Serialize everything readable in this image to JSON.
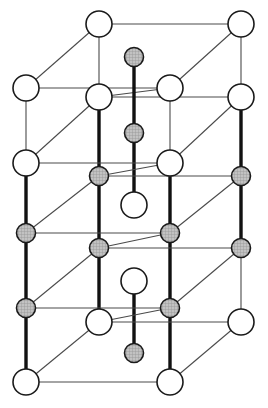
{
  "figure": {
    "width": 268,
    "height": 408,
    "background_color": "#ffffff"
  },
  "style": {
    "open_atom_fill": "#ffffff",
    "open_atom_stroke": "#1a1a1a",
    "open_atom_stroke_width": 1.6,
    "shaded_atom_fill": "#b9b9b9",
    "shaded_atom_stroke": "#1a1a1a",
    "shaded_atom_stroke_width": 1.6,
    "hatch_color": "#8c8c8c",
    "thin_bond_color": "#4a4a4a",
    "thin_bond_width": 1.1,
    "thick_bond_color": "#111111",
    "thick_bond_width": 3.4,
    "open_atom_radius": 13,
    "shaded_atom_radius": 9.5
  },
  "legend": {
    "open_atom_label": "large open atom",
    "shaded_atom_label": "small shaded atom",
    "thin_bond_label": "back edge",
    "thick_bond_label": "front vertical edge"
  },
  "geometry": {
    "columns": {
      "left_front": 26,
      "left_back": 99,
      "center": 134,
      "right_front": 170,
      "right_back": 241
    },
    "rows": {
      "top_back": 24,
      "top_front": 97,
      "mid_upper_back": 163,
      "mid_upper_front": 176,
      "mid_lower_back": 233,
      "mid_lower_front": 248,
      "bottom_back": 308,
      "bottom_front": 322,
      "base": 382
    }
  },
  "atoms": [
    {
      "id": "a1",
      "name": "atom-top-back-left",
      "x": 99,
      "y": 24,
      "type": "open"
    },
    {
      "id": "a2",
      "name": "atom-top-back-right",
      "x": 241,
      "y": 24,
      "type": "open"
    },
    {
      "id": "a3",
      "name": "atom-center-upper-shaded",
      "x": 134,
      "y": 57,
      "type": "shaded"
    },
    {
      "id": "a4",
      "name": "atom-upper-left-outer",
      "x": 26,
      "y": 88,
      "type": "open"
    },
    {
      "id": "a5",
      "name": "atom-upper-mid-left",
      "x": 99,
      "y": 97,
      "type": "open"
    },
    {
      "id": "a6",
      "name": "atom-upper-mid-right",
      "x": 170,
      "y": 88,
      "type": "open"
    },
    {
      "id": "a7",
      "name": "atom-upper-right-outer",
      "x": 241,
      "y": 97,
      "type": "open"
    },
    {
      "id": "a8",
      "name": "atom-center-second-shaded",
      "x": 134,
      "y": 133,
      "type": "shaded"
    },
    {
      "id": "a9",
      "name": "atom-mid-left-outer",
      "x": 26,
      "y": 163,
      "type": "open"
    },
    {
      "id": "a10",
      "name": "atom-mid-left-shaded",
      "x": 99,
      "y": 176,
      "type": "shaded"
    },
    {
      "id": "a11",
      "name": "atom-mid-right-open",
      "x": 170,
      "y": 163,
      "type": "open"
    },
    {
      "id": "a12",
      "name": "atom-mid-right-shaded",
      "x": 241,
      "y": 176,
      "type": "shaded"
    },
    {
      "id": "a13",
      "name": "atom-center-open-upper",
      "x": 134,
      "y": 205,
      "type": "open"
    },
    {
      "id": "a14",
      "name": "atom-midlow-left-shaded",
      "x": 26,
      "y": 233,
      "type": "shaded"
    },
    {
      "id": "a15",
      "name": "atom-midlow-inner-shaded",
      "x": 99,
      "y": 248,
      "type": "shaded"
    },
    {
      "id": "a16",
      "name": "atom-midlow-right-shaded",
      "x": 170,
      "y": 233,
      "type": "shaded"
    },
    {
      "id": "a17",
      "name": "atom-midlow-outer-shaded",
      "x": 241,
      "y": 248,
      "type": "shaded"
    },
    {
      "id": "a18",
      "name": "atom-center-open-lower",
      "x": 134,
      "y": 281,
      "type": "open"
    },
    {
      "id": "a19",
      "name": "atom-low-left-shaded",
      "x": 26,
      "y": 308,
      "type": "shaded"
    },
    {
      "id": "a20",
      "name": "atom-low-inner-open",
      "x": 99,
      "y": 322,
      "type": "open"
    },
    {
      "id": "a21",
      "name": "atom-low-right-shaded",
      "x": 170,
      "y": 308,
      "type": "shaded"
    },
    {
      "id": "a22",
      "name": "atom-low-outer-open",
      "x": 241,
      "y": 322,
      "type": "open"
    },
    {
      "id": "a23",
      "name": "atom-center-bottom-shaded",
      "x": 134,
      "y": 353,
      "type": "shaded"
    },
    {
      "id": "a24",
      "name": "atom-base-front-left",
      "x": 26,
      "y": 382,
      "type": "open"
    },
    {
      "id": "a25",
      "name": "atom-base-front-right",
      "x": 170,
      "y": 382,
      "type": "open"
    }
  ],
  "bonds": [
    {
      "name": "bond-top-back-horizontal",
      "x1": 99,
      "y1": 24,
      "x2": 241,
      "y2": 24,
      "weight": "thin"
    },
    {
      "name": "bond-top-back-left-diagonal",
      "x1": 99,
      "y1": 24,
      "x2": 26,
      "y2": 88,
      "weight": "thin"
    },
    {
      "name": "bond-top-back-right-diagonal",
      "x1": 241,
      "y1": 24,
      "x2": 170,
      "y2": 88,
      "weight": "thin"
    },
    {
      "name": "bond-topbackleft-vertical",
      "x1": 99,
      "y1": 24,
      "x2": 99,
      "y2": 97,
      "weight": "thin"
    },
    {
      "name": "bond-topbackright-vertical",
      "x1": 241,
      "y1": 24,
      "x2": 241,
      "y2": 97,
      "weight": "thin"
    },
    {
      "name": "bond-upper-left-horizontal",
      "x1": 26,
      "y1": 88,
      "x2": 170,
      "y2": 88,
      "weight": "thin"
    },
    {
      "name": "bond-upper-front-horizontal",
      "x1": 99,
      "y1": 97,
      "x2": 241,
      "y2": 97,
      "weight": "thin"
    },
    {
      "name": "bond-upper-left-vertical",
      "x1": 26,
      "y1": 88,
      "x2": 26,
      "y2": 163,
      "weight": "thin"
    },
    {
      "name": "bond-upper-right-vertical",
      "x1": 170,
      "y1": 88,
      "x2": 170,
      "y2": 163,
      "weight": "thin"
    },
    {
      "name": "bond-upper-mid-left-diag",
      "x1": 170,
      "y1": 88,
      "x2": 99,
      "y2": 97,
      "weight": "thin"
    },
    {
      "name": "bond-upper-outer-right-diag",
      "x1": 241,
      "y1": 97,
      "x2": 170,
      "y2": 163,
      "weight": "thin"
    },
    {
      "name": "bond-upper-left-down-diag",
      "x1": 99,
      "y1": 97,
      "x2": 26,
      "y2": 163,
      "weight": "thin"
    },
    {
      "name": "bond-center-chain-top",
      "x1": 134,
      "y1": 57,
      "x2": 134,
      "y2": 133,
      "weight": "thick"
    },
    {
      "name": "bond-center-chain-second",
      "x1": 134,
      "y1": 133,
      "x2": 134,
      "y2": 205,
      "weight": "thick"
    },
    {
      "name": "bond-frontleft-col-upper",
      "x1": 99,
      "y1": 97,
      "x2": 99,
      "y2": 176,
      "weight": "thick"
    },
    {
      "name": "bond-frontleft-col-mid",
      "x1": 99,
      "y1": 176,
      "x2": 99,
      "y2": 248,
      "weight": "thick"
    },
    {
      "name": "bond-frontleft-col-lower",
      "x1": 99,
      "y1": 248,
      "x2": 99,
      "y2": 322,
      "weight": "thick"
    },
    {
      "name": "bond-frontright-col-upper",
      "x1": 170,
      "y1": 163,
      "x2": 170,
      "y2": 233,
      "weight": "thick"
    },
    {
      "name": "bond-frontright-col-lower",
      "x1": 170,
      "y1": 233,
      "x2": 170,
      "y2": 308,
      "weight": "thick"
    },
    {
      "name": "bond-frontright-col-base",
      "x1": 170,
      "y1": 308,
      "x2": 170,
      "y2": 382,
      "weight": "thick"
    },
    {
      "name": "bond-outerleft-col-upper",
      "x1": 26,
      "y1": 163,
      "x2": 26,
      "y2": 233,
      "weight": "thick"
    },
    {
      "name": "bond-outerleft-col-mid",
      "x1": 26,
      "y1": 233,
      "x2": 26,
      "y2": 308,
      "weight": "thick"
    },
    {
      "name": "bond-outerleft-col-base",
      "x1": 26,
      "y1": 308,
      "x2": 26,
      "y2": 382,
      "weight": "thick"
    },
    {
      "name": "bond-outerright-col-upper",
      "x1": 241,
      "y1": 97,
      "x2": 241,
      "y2": 176,
      "weight": "thick"
    },
    {
      "name": "bond-outerright-col-mid",
      "x1": 241,
      "y1": 176,
      "x2": 241,
      "y2": 248,
      "weight": "thick"
    },
    {
      "name": "bond-outerright-col-lower",
      "x1": 241,
      "y1": 248,
      "x2": 241,
      "y2": 322,
      "weight": "thin"
    },
    {
      "name": "bond-mid-back-horizontal",
      "x1": 26,
      "y1": 163,
      "x2": 170,
      "y2": 163,
      "weight": "thin"
    },
    {
      "name": "bond-mid-front-horizontal",
      "x1": 99,
      "y1": 176,
      "x2": 241,
      "y2": 176,
      "weight": "thin"
    },
    {
      "name": "bond-mid-inner-diag",
      "x1": 170,
      "y1": 163,
      "x2": 99,
      "y2": 176,
      "weight": "thin"
    },
    {
      "name": "bond-mid-left-diag-down",
      "x1": 99,
      "y1": 176,
      "x2": 26,
      "y2": 233,
      "weight": "thin"
    },
    {
      "name": "bond-mid-right-diag-down",
      "x1": 241,
      "y1": 176,
      "x2": 170,
      "y2": 233,
      "weight": "thin"
    },
    {
      "name": "bond-midlow-back-horizontal",
      "x1": 26,
      "y1": 233,
      "x2": 170,
      "y2": 233,
      "weight": "thin"
    },
    {
      "name": "bond-midlow-front-horizontal",
      "x1": 99,
      "y1": 248,
      "x2": 241,
      "y2": 248,
      "weight": "thin"
    },
    {
      "name": "bond-midlow-inner-diag",
      "x1": 170,
      "y1": 233,
      "x2": 99,
      "y2": 248,
      "weight": "thin"
    },
    {
      "name": "bond-midlow-left-diag-down",
      "x1": 99,
      "y1": 248,
      "x2": 26,
      "y2": 308,
      "weight": "thin"
    },
    {
      "name": "bond-midlow-right-diag-down",
      "x1": 241,
      "y1": 248,
      "x2": 170,
      "y2": 308,
      "weight": "thin"
    },
    {
      "name": "bond-center-chain-lower",
      "x1": 134,
      "y1": 281,
      "x2": 134,
      "y2": 353,
      "weight": "thick"
    },
    {
      "name": "bond-low-back-horizontal",
      "x1": 26,
      "y1": 308,
      "x2": 170,
      "y2": 308,
      "weight": "thin"
    },
    {
      "name": "bond-low-front-horizontal",
      "x1": 99,
      "y1": 322,
      "x2": 241,
      "y2": 322,
      "weight": "thin"
    },
    {
      "name": "bond-low-inner-diag",
      "x1": 170,
      "y1": 308,
      "x2": 99,
      "y2": 322,
      "weight": "thin"
    },
    {
      "name": "bond-low-left-diag-down",
      "x1": 99,
      "y1": 322,
      "x2": 26,
      "y2": 382,
      "weight": "thin"
    },
    {
      "name": "bond-low-right-diag-down",
      "x1": 241,
      "y1": 322,
      "x2": 170,
      "y2": 382,
      "weight": "thin"
    },
    {
      "name": "bond-base-front-horizontal",
      "x1": 26,
      "y1": 382,
      "x2": 170,
      "y2": 382,
      "weight": "thin"
    }
  ]
}
